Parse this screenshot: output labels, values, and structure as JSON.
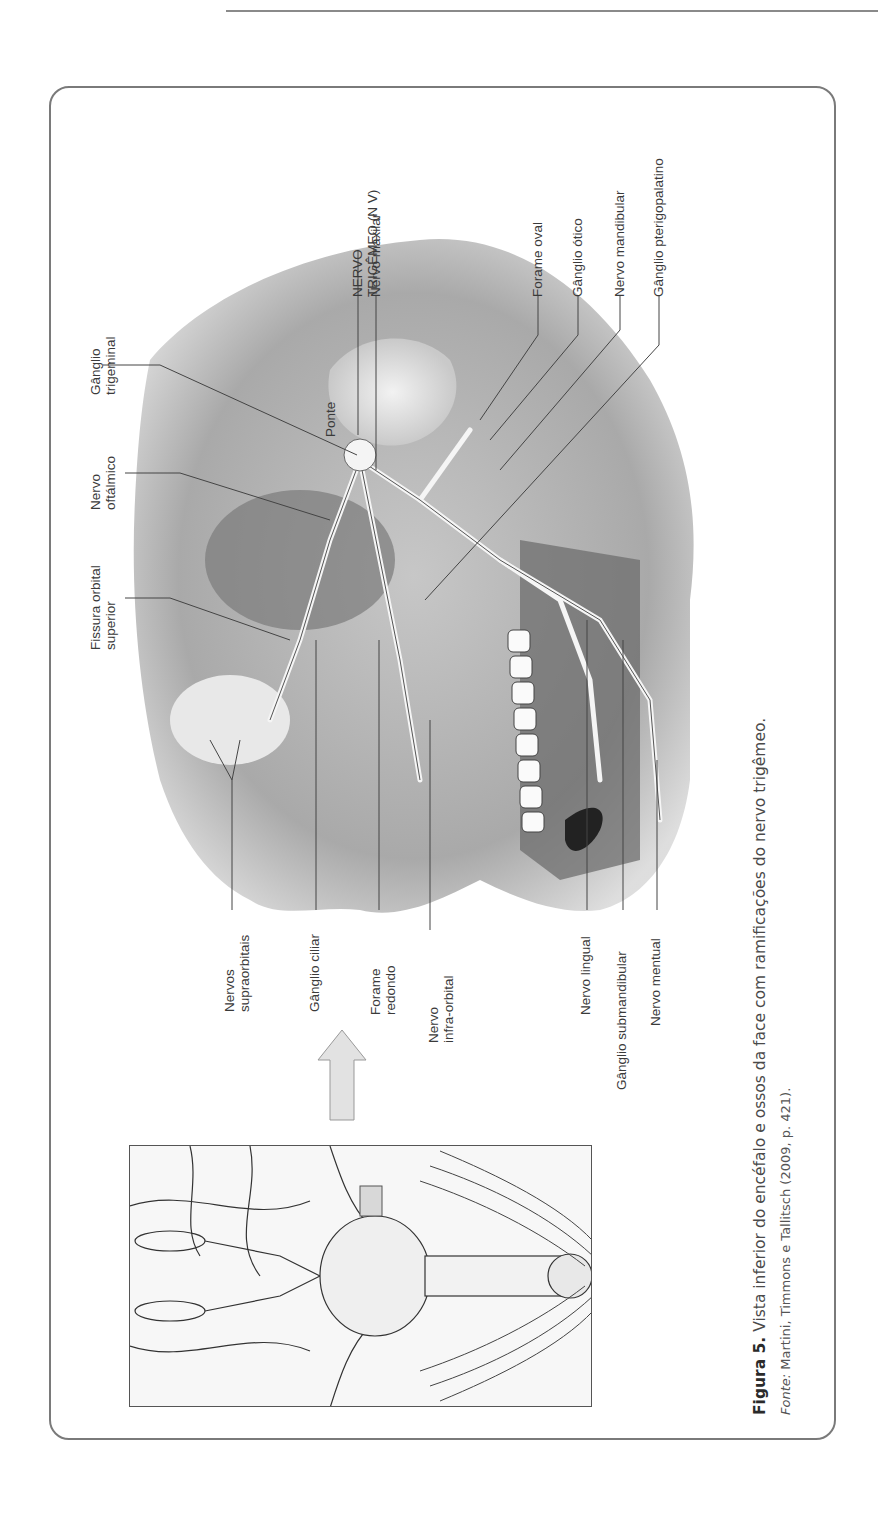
{
  "page": {
    "orientation": "rotated-90-ccw"
  },
  "figure": {
    "number_label": "Figura 5.",
    "caption": "Vista inferior do encéfalo e ossos da face com ramificações do nervo trigêmeo.",
    "source_label": "Fonte:",
    "source_text": "Martini, Timmons e Tallitsch (2009, p. 421).",
    "labels_top": [
      {
        "id": "ganglio-trigeminal",
        "line1": "Gânglio",
        "line2": "trigeminal"
      },
      {
        "id": "ponte",
        "line1": "Ponte",
        "line2": ""
      },
      {
        "id": "nervo-trigemeo",
        "line1": "NERVO",
        "line2": "TRIGÊMEO (N V)"
      },
      {
        "id": "nervo-maxilar",
        "line1": "Nervo maxilar",
        "line2": ""
      },
      {
        "id": "forame-oval",
        "line1": "Forame oval",
        "line2": ""
      },
      {
        "id": "ganglio-otico",
        "line1": "Gânglio ótico",
        "line2": ""
      },
      {
        "id": "nervo-mandibular",
        "line1": "Nervo mandibular",
        "line2": ""
      },
      {
        "id": "ganglio-pterigopalatino",
        "line1": "Gânglio pterigopalatino",
        "line2": ""
      }
    ],
    "labels_left": [
      {
        "id": "nervo-oftalmico",
        "line1": "Nervo",
        "line2": "oftálmico"
      },
      {
        "id": "fissura-orbital-superior",
        "line1": "Fissura orbital",
        "line2": "superior"
      }
    ],
    "labels_bottom": [
      {
        "id": "nervos-supraorbitais",
        "line1": "Nervos",
        "line2": "supraorbitais"
      },
      {
        "id": "ganglio-ciliar",
        "line1": "Gânglio ciliar",
        "line2": ""
      },
      {
        "id": "forame-redondo",
        "line1": "Forame",
        "line2": "redondo"
      },
      {
        "id": "nervo-infra-orbital",
        "line1": "Nervo",
        "line2": "infra-orbital"
      },
      {
        "id": "nervo-lingual",
        "line1": "Nervo lingual",
        "line2": ""
      },
      {
        "id": "ganglio-submandibular",
        "line1": "Gânglio submandibular",
        "line2": ""
      },
      {
        "id": "nervo-mentual",
        "line1": "Nervo mentual",
        "line2": ""
      }
    ]
  }
}
